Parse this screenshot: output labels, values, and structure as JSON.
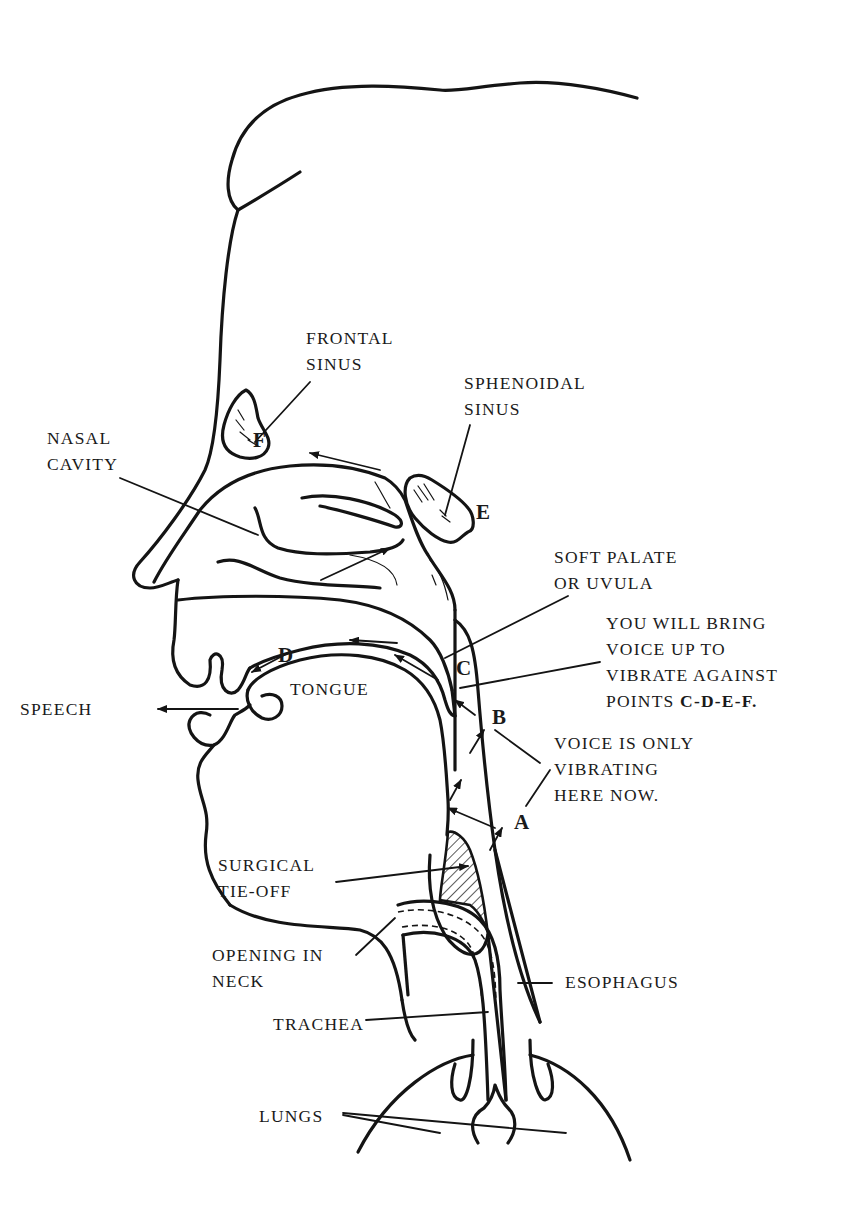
{
  "diagram": {
    "labels": {
      "frontal_sinus": [
        "FRONTAL",
        "SINUS"
      ],
      "sphenoidal_sinus": [
        "SPHENOIDAL",
        "SINUS"
      ],
      "nasal_cavity": [
        "NASAL",
        "CAVITY"
      ],
      "soft_palate": [
        "SOFT PALATE",
        "OR UVULA"
      ],
      "instruction": [
        "YOU WILL BRING",
        "VOICE UP TO",
        "VIBRATE AGAINST",
        "POINTS "
      ],
      "instruction_points": "C-D-E-F.",
      "voice_now": [
        "VOICE IS ONLY",
        "VIBRATING",
        "HERE NOW."
      ],
      "speech": "SPEECH",
      "tongue": "TONGUE",
      "surgical_tieoff": [
        "SURGICAL",
        "TIE-OFF"
      ],
      "opening_in_neck": [
        "OPENING IN",
        "NECK"
      ],
      "esophagus": "ESOPHAGUS",
      "trachea": "TRACHEA",
      "lungs": "LUNGS"
    },
    "points": {
      "A": "A",
      "B": "B",
      "C": "C",
      "D": "D",
      "E": "E",
      "F": "F"
    },
    "colors": {
      "ink": "#141414",
      "background": "#ffffff"
    }
  }
}
